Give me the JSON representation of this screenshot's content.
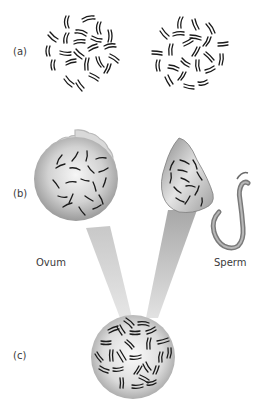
{
  "figure": {
    "panels": [
      {
        "id": "a",
        "label": "(a)",
        "description": "Two clusters of paired chromosomes"
      },
      {
        "id": "b",
        "label": "(b)",
        "description": "Ovum and sperm each carrying single chromosomes"
      },
      {
        "id": "c",
        "label": "(c)",
        "description": "Fertilized cell with paired chromosomes"
      }
    ],
    "cell_labels": {
      "ovum": "Ovum",
      "sperm": "Sperm"
    },
    "colors": {
      "background": "#ffffff",
      "chromosome": "#1a1a1a",
      "cell_fill_light": "#f2f2f2",
      "cell_fill_dark": "#9a9a9a",
      "ovum_membrane": "#d8d8d8",
      "ovum_membrane_edge": "#bdbdbd",
      "beam": "#d0d0d0",
      "label_text": "#3a3a3a"
    }
  }
}
